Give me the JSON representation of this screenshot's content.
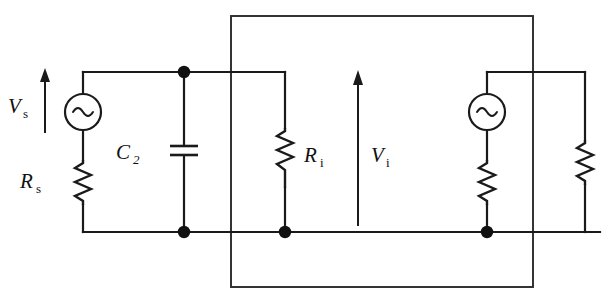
{
  "figure": {
    "kind": "electrical-circuit-schematic",
    "background_color": "#ffffff",
    "line_color": "#1a1a1a",
    "width": 615,
    "height": 306
  },
  "labels": {
    "source_voltage": {
      "symbol": "V",
      "subscript": "s",
      "full": "Vs"
    },
    "source_resistance": {
      "symbol": "R",
      "subscript": "s",
      "full": "Rs"
    },
    "shunt_capacitor": {
      "symbol": "C",
      "subscript": "2",
      "full": "C2"
    },
    "input_resistance": {
      "symbol": "R",
      "subscript": "i",
      "full": "Ri"
    },
    "input_voltage": {
      "symbol": "V",
      "subscript": "i",
      "full": "Vi"
    }
  },
  "components": [
    {
      "id": "vs-source",
      "type": "ac-voltage-source",
      "label": "Vs",
      "side": "left"
    },
    {
      "id": "rs-resistor",
      "type": "resistor",
      "label": "Rs",
      "side": "left"
    },
    {
      "id": "c2-capacitor",
      "type": "capacitor",
      "label": "C2",
      "side": "middle-left"
    },
    {
      "id": "ri-resistor",
      "type": "resistor",
      "label": "Ri",
      "side": "middle"
    },
    {
      "id": "right-source",
      "type": "ac-voltage-source",
      "label": "",
      "side": "right"
    },
    {
      "id": "right-source-resistor",
      "type": "resistor",
      "label": "",
      "side": "right"
    },
    {
      "id": "far-right-resistor",
      "type": "resistor",
      "label": "",
      "side": "far-right"
    }
  ],
  "arrows": [
    {
      "id": "vs-arrow",
      "label": "Vs",
      "direction": "up"
    },
    {
      "id": "vi-arrow",
      "label": "Vi",
      "direction": "up"
    }
  ],
  "nodes": [
    {
      "id": "node-top-mid",
      "x": 184,
      "y": 72
    },
    {
      "id": "node-bottom-mid-left",
      "x": 184,
      "y": 232
    },
    {
      "id": "node-bottom-ri",
      "x": 285,
      "y": 232
    },
    {
      "id": "node-bottom-right-src",
      "x": 487,
      "y": 232
    }
  ],
  "overlay_box": {
    "id": "equivalent-two-port-box",
    "x": 231,
    "y": 16,
    "width": 302,
    "height": 271
  }
}
